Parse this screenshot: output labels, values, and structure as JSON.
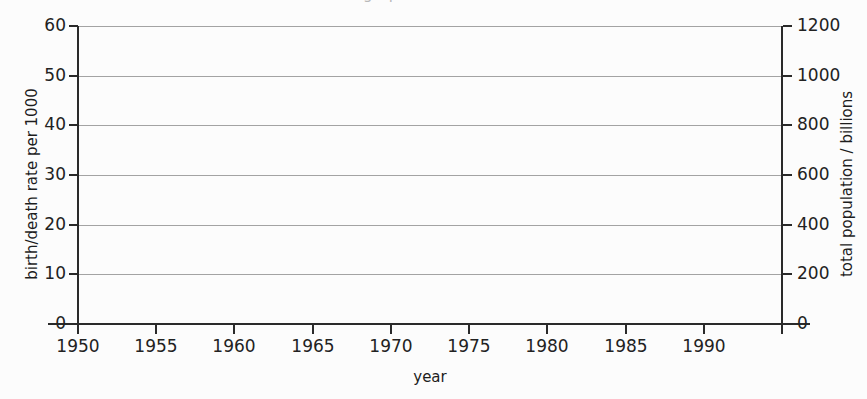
{
  "chart_data": {
    "type": "line",
    "title": "",
    "title_remnant": "demographic transition",
    "xlabel": "year",
    "ylabel": "birth/death rate per 1000",
    "ylabel_right": "total population / billions",
    "xlim": [
      1950,
      1995
    ],
    "ylim": [
      0,
      60
    ],
    "ylim_right": [
      0,
      1200
    ],
    "grid": true,
    "legend": "none",
    "series": [],
    "x_ticks": [
      {
        "value": 1950,
        "label": "1950"
      },
      {
        "value": 1955,
        "label": "1955"
      },
      {
        "value": 1960,
        "label": "1960"
      },
      {
        "value": 1965,
        "label": "1965"
      },
      {
        "value": 1970,
        "label": "1970"
      },
      {
        "value": 1975,
        "label": "1975"
      },
      {
        "value": 1980,
        "label": "1980"
      },
      {
        "value": 1985,
        "label": "1985"
      },
      {
        "value": 1990,
        "label": "1990"
      }
    ],
    "x_minor_tick_values": [
      1950,
      1955,
      1960,
      1965,
      1970,
      1975,
      1980,
      1985,
      1990,
      1995
    ],
    "y_ticks_left": [
      {
        "value": 0,
        "label": "0"
      },
      {
        "value": 10,
        "label": "10"
      },
      {
        "value": 20,
        "label": "20"
      },
      {
        "value": 30,
        "label": "30"
      },
      {
        "value": 40,
        "label": "40"
      },
      {
        "value": 50,
        "label": "50"
      },
      {
        "value": 60,
        "label": "60"
      }
    ],
    "y_ticks_right": [
      {
        "value": 0,
        "label": "0"
      },
      {
        "value": 200,
        "label": "200"
      },
      {
        "value": 400,
        "label": "400"
      },
      {
        "value": 600,
        "label": "600"
      },
      {
        "value": 800,
        "label": "800"
      },
      {
        "value": 1000,
        "label": "1000"
      },
      {
        "value": 1200,
        "label": "1200"
      }
    ],
    "colors": {
      "background": "#fcfcfc",
      "axis": "#2a2a2a",
      "gridline": "#a3a3a3",
      "text": "#1d1d1d"
    }
  }
}
